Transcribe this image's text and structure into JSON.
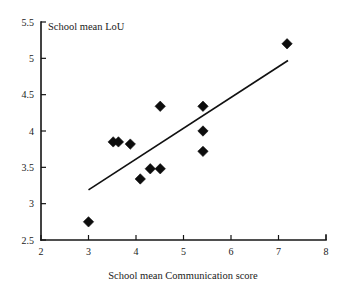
{
  "chart_data": {
    "type": "scatter",
    "title": "School mean LoU",
    "xlabel": "School mean Communication score",
    "ylabel": "School mean LoU",
    "xlim": [
      2,
      8
    ],
    "ylim": [
      2.5,
      5.5
    ],
    "xticks": [
      "2",
      "3",
      "4",
      "5",
      "6",
      "7",
      "8"
    ],
    "yticks": [
      "2.5",
      "3",
      "3.5",
      "4",
      "4.5",
      "5",
      "5.5"
    ],
    "xtick_values": [
      2,
      3,
      4,
      5,
      6,
      7,
      8
    ],
    "ytick_values": [
      2.5,
      3,
      3.5,
      4,
      4.5,
      5,
      5.5
    ],
    "grid": false,
    "legend": null,
    "marker_style": "filled-diamond",
    "marker_color": "#0d0d0d",
    "series": [
      {
        "name": "Schools",
        "points": [
          {
            "x": 3.0,
            "y": 2.75
          },
          {
            "x": 3.52,
            "y": 3.85
          },
          {
            "x": 3.63,
            "y": 3.85
          },
          {
            "x": 3.88,
            "y": 3.82
          },
          {
            "x": 4.09,
            "y": 3.34
          },
          {
            "x": 4.3,
            "y": 3.48
          },
          {
            "x": 4.51,
            "y": 3.48
          },
          {
            "x": 4.51,
            "y": 4.34
          },
          {
            "x": 5.41,
            "y": 4.34
          },
          {
            "x": 5.41,
            "y": 4.0
          },
          {
            "x": 5.41,
            "y": 3.72
          },
          {
            "x": 7.18,
            "y": 5.2
          }
        ]
      }
    ],
    "trendline": {
      "type": "linear",
      "x_start": 3.0,
      "y_start": 3.19,
      "x_end": 7.2,
      "y_end": 4.97
    }
  }
}
